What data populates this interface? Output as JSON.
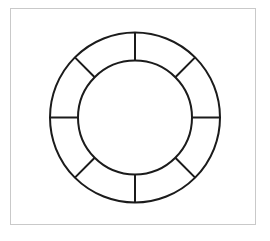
{
  "figure": {
    "background_color": "#ffffff"
  },
  "frame": {
    "name": "figure-border",
    "x": 10,
    "y": 8,
    "width": 246,
    "height": 217,
    "border_color": "#c9c9c9",
    "border_width": 1,
    "fill_color": "#ffffff"
  },
  "annulus": {
    "center_x": 135,
    "center_y": 117.5,
    "outer_radius": 85,
    "inner_radius": 57,
    "stroke_color": "#1b1b1b",
    "stroke_width": 2,
    "fill_color": "none",
    "segment_count": 8
  },
  "spokes": [
    {
      "label": "spoke-top",
      "angle_deg": 270
    },
    {
      "label": "spoke-upper-right",
      "angle_deg": 315
    },
    {
      "label": "spoke-right",
      "angle_deg": 0
    },
    {
      "label": "spoke-lower-right",
      "angle_deg": 45
    },
    {
      "label": "spoke-bottom",
      "angle_deg": 90
    },
    {
      "label": "spoke-lower-left",
      "angle_deg": 135
    },
    {
      "label": "spoke-left",
      "angle_deg": 180
    },
    {
      "label": "spoke-upper-left",
      "angle_deg": 225
    }
  ]
}
